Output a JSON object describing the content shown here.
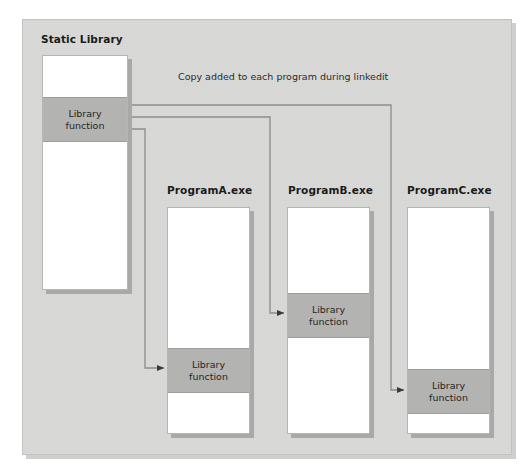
{
  "diagram": {
    "type": "static-linking-illustration",
    "caption": "Copy added to each program during linkedit",
    "library": {
      "title": "Static Library",
      "band_label_line1": "Library",
      "band_label_line2": "function"
    },
    "programs": [
      {
        "title": "ProgramA.exe",
        "band_label_line1": "Library",
        "band_label_line2": "function"
      },
      {
        "title": "ProgramB.exe",
        "band_label_line1": "Library",
        "band_label_line2": "function"
      },
      {
        "title": "ProgramC.exe",
        "band_label_line1": "Library",
        "band_label_line2": "function"
      }
    ],
    "colors": {
      "panel_background": "#d8d8d6",
      "module_fill": "#ffffff",
      "band_fill": "#b3b3b1",
      "line": "#8d8d8b",
      "text": "#1b1b1b"
    }
  }
}
